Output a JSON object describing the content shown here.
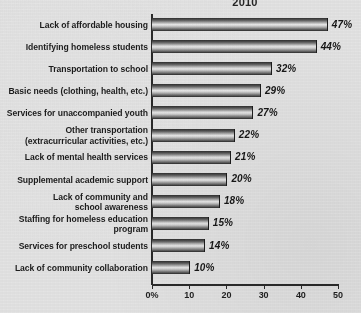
{
  "chart_data": {
    "type": "bar",
    "orientation": "horizontal",
    "title": "2010",
    "xlabel": "",
    "ylabel": "",
    "xlim": [
      0,
      50
    ],
    "grid": false,
    "legend": null,
    "xticks": [
      "0%",
      "10",
      "20",
      "30",
      "40",
      "50"
    ],
    "xtick_values": [
      0,
      10,
      20,
      30,
      40,
      50
    ],
    "categories": [
      "Lack of affordable housing",
      "Identifying homeless students",
      "Transportation to school",
      "Basic needs (clothing, health, etc.)",
      "Services for unaccompanied youth",
      "Other transportation (extracurricular activities, etc.)",
      "Lack of mental health services",
      "Supplemental academic support",
      "Lack of community and school awareness",
      "Staffing for homeless education program",
      "Services for preschool students",
      "Lack of community collaboration"
    ],
    "category_lines": [
      [
        "Lack of affordable housing"
      ],
      [
        "Identifying homeless students"
      ],
      [
        "Transportation to school"
      ],
      [
        "Basic needs (clothing, health, etc.)"
      ],
      [
        "Services for unaccompanied youth"
      ],
      [
        "Other transportation",
        "(extracurricular activities, etc.)"
      ],
      [
        "Lack of mental health services"
      ],
      [
        "Supplemental academic support"
      ],
      [
        "Lack of community and",
        "school awareness"
      ],
      [
        "Staffing for homeless education",
        "program"
      ],
      [
        "Services for preschool students"
      ],
      [
        "Lack of community collaboration"
      ]
    ],
    "values": [
      47,
      44,
      32,
      29,
      27,
      22,
      21,
      20,
      18,
      15,
      14,
      10
    ],
    "value_labels": [
      "47%",
      "44%",
      "32%",
      "29%",
      "27%",
      "22%",
      "21%",
      "20%",
      "18%",
      "15%",
      "14%",
      "10%"
    ]
  },
  "style": {
    "background": "#e4e4e4",
    "bar_dark": "#232323",
    "bar_light": "#e9e9e9",
    "axis_color": "#2a2a2a",
    "text_color": "#1c1c1c"
  }
}
